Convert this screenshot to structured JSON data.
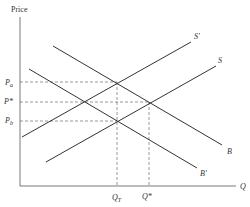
{
  "diagram": {
    "type": "supply-demand-tax",
    "axes": {
      "y_label": "Price",
      "x_label": "Q"
    },
    "price_labels": {
      "pa": "P",
      "pa_sub": "a",
      "pstar": "P*",
      "pb": "P",
      "pb_sub": "b"
    },
    "quantity_labels": {
      "qt": "Q",
      "qt_sub": "T",
      "qstar": "Q*"
    },
    "curves": {
      "s_prime": "S′",
      "s": "S",
      "b": "B",
      "b_prime": "B′"
    },
    "colors": {
      "line": "#333333",
      "dashed": "#555555",
      "background": "#ffffff"
    }
  }
}
